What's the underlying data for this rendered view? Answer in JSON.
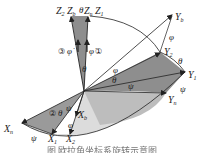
{
  "diagram": {
    "axes": {
      "Z2": {
        "base": "Z",
        "sub": "2"
      },
      "Zb": {
        "base": "Z",
        "sub": "b"
      },
      "Zn": {
        "base": "Z",
        "sub": "n"
      },
      "Z1": {
        "base": "Z",
        "sub": "1"
      },
      "Yb": {
        "base": "Y",
        "sub": "b"
      },
      "Y2": {
        "base": "Y",
        "sub": "2"
      },
      "Y1": {
        "base": "Y",
        "sub": "1"
      },
      "Yn": {
        "base": "Y",
        "sub": "n"
      },
      "Xn": {
        "base": "X",
        "sub": "n"
      },
      "X1": {
        "base": "X",
        "sub": "1"
      },
      "X2": {
        "base": "X",
        "sub": "2"
      },
      "Xb": {
        "base": "X",
        "sub": "b"
      }
    },
    "angles": {
      "theta": "θ",
      "phi": "φ",
      "psi": "ψ",
      "phi_dot": "φ̇"
    },
    "steps": {
      "step1": "①",
      "step2": "②",
      "step3": "③"
    },
    "colors": {
      "dark_fill": "#8a8a8a",
      "light_fill": "#d4d4d4",
      "line": "#222222"
    }
  },
  "caption": "图 欧拉角坐标系旋转示意图"
}
